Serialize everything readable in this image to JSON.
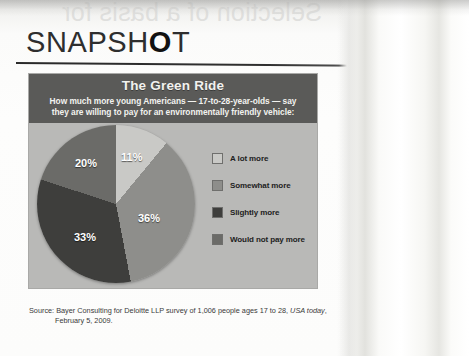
{
  "page": {
    "ghost_text": "Selection of a basis for",
    "section_heading_prefix": "SNAPSH",
    "section_heading_bold": "O",
    "section_heading_suffix": "T"
  },
  "panel": {
    "title": "The Green Ride",
    "subtitle_line_1": "How much more young Americans — 17-to-28-year-olds — say",
    "subtitle_line_2": "they are willing to pay for an environmentally friendly vehicle:",
    "header_bg": "#5a5a58",
    "body_bg": "#b9b9b7"
  },
  "source": {
    "line_1_prefix": "Source: Bayer Consulting for Deloitte LLP survey of 1,006 people ages 17 to 28, ",
    "line_1_italic": "USA today",
    "line_1_suffix": ",",
    "line_2": "February 5, 2009."
  },
  "chart_data": {
    "type": "pie",
    "title": "The Green Ride",
    "subtitle": "How much more young Americans — 17-to-28-year-olds — say they are willing to pay for an environmentally friendly vehicle:",
    "categories": [
      "A lot more",
      "Somewhat more",
      "Slightly more",
      "Would not pay more"
    ],
    "values": [
      11,
      36,
      33,
      20
    ],
    "value_labels": [
      "11%",
      "36%",
      "33%",
      "20%"
    ],
    "colors": [
      "#c9c9c6",
      "#8e8e8b",
      "#3e3e3c",
      "#6b6b68"
    ],
    "legend_position": "right",
    "grid": false,
    "start_angle_deg": 0,
    "direction": "clockwise",
    "source": "Bayer Consulting for Deloitte LLP survey of 1,006 people ages 17 to 28, USA today, February 5, 2009."
  }
}
